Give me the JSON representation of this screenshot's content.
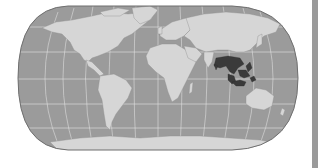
{
  "map": {
    "title": "World map highlighting Southeast Asia",
    "projection": "Robinson-like pseudo-cylindrical",
    "highlight_region": "Southeast Asia",
    "colors": {
      "ocean": "#9b9b9b",
      "land": "#d6d6d6",
      "highlight": "#3a3a3a",
      "graticule": "#e4e4e4",
      "border": "#6f6f6f",
      "lakes": "#8a8a8a",
      "side_bar": "#9a9a9a"
    },
    "graticule": {
      "parallels_y": [
        27,
        52,
        80,
        107,
        130
      ],
      "meridian_count": 13
    }
  }
}
